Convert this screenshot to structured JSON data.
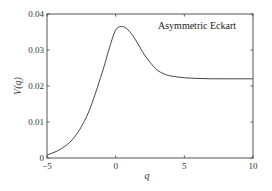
{
  "chart_data": {
    "type": "line",
    "title": "",
    "annotation": "Asymmetric Eckart",
    "xlabel": "q",
    "ylabel": "V(q)",
    "xlim": [
      -5,
      10
    ],
    "ylim": [
      0,
      0.04
    ],
    "xticks": [
      -5,
      0,
      5,
      10
    ],
    "xtick_labels": [
      "−5",
      "0",
      "5",
      "10"
    ],
    "yticks": [
      0,
      0.01,
      0.02,
      0.03,
      0.04
    ],
    "ytick_labels": [
      "0",
      "0.01",
      "0.02",
      "0.03",
      "0.04"
    ],
    "grid": false,
    "legend": null,
    "series": [
      {
        "name": "Asymmetric Eckart",
        "color": "#444444",
        "x": [
          -5,
          -4,
          -3,
          -2,
          -1,
          -0.5,
          0,
          0.5,
          1,
          1.5,
          2,
          2.5,
          3,
          3.5,
          4,
          5,
          6,
          7,
          8,
          9,
          10
        ],
        "values": [
          0.0008,
          0.0025,
          0.0058,
          0.0125,
          0.0235,
          0.03,
          0.0355,
          0.0365,
          0.0352,
          0.0325,
          0.0292,
          0.0266,
          0.0245,
          0.0234,
          0.0228,
          0.0223,
          0.0221,
          0.022,
          0.022,
          0.022,
          0.022
        ]
      }
    ]
  }
}
